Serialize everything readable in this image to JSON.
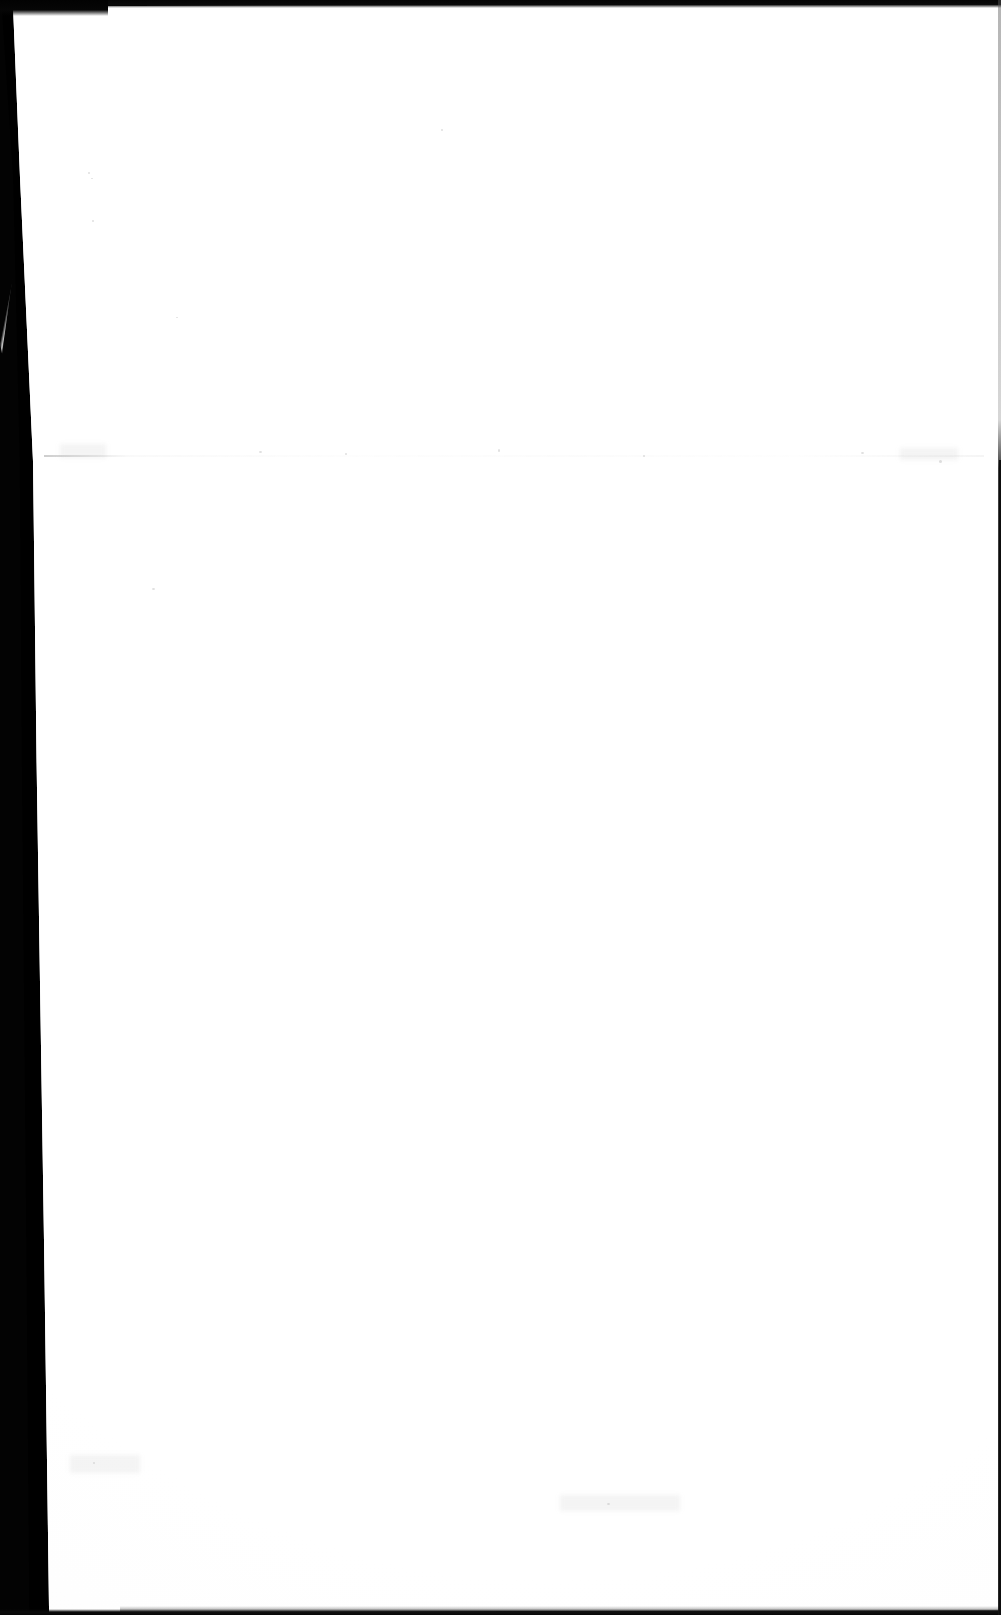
{
  "document": {
    "kind": "scanned-page",
    "page_content": "",
    "page_note": "blank page",
    "width_px": 1001,
    "height_px": 1615
  },
  "colors": {
    "paper": "#fefefe",
    "scan_bed": "#030303",
    "border": "#0a0a0a",
    "artifact": "#bababa"
  },
  "artifacts": {
    "left_gutter": "scanner-bed-shadow",
    "left_sliver": "page-corner-lift",
    "top_border": "scan-edge-top",
    "bottom_border": "scan-edge-bottom",
    "right_border": "scan-edge-right",
    "fold_seam": "horizontal-fold-crease"
  },
  "specks": [
    {
      "x": 88,
      "y": 172,
      "w": 2,
      "h": 2
    },
    {
      "x": 91,
      "y": 178,
      "w": 2,
      "h": 1
    },
    {
      "x": 92,
      "y": 220,
      "w": 2,
      "h": 2
    },
    {
      "x": 441,
      "y": 129,
      "w": 2,
      "h": 2
    },
    {
      "x": 176,
      "y": 317,
      "w": 2,
      "h": 1
    },
    {
      "x": 259,
      "y": 451,
      "w": 3,
      "h": 2
    },
    {
      "x": 345,
      "y": 453,
      "w": 2,
      "h": 2
    },
    {
      "x": 498,
      "y": 449,
      "w": 2,
      "h": 3
    },
    {
      "x": 643,
      "y": 455,
      "w": 2,
      "h": 2
    },
    {
      "x": 861,
      "y": 452,
      "w": 3,
      "h": 2
    },
    {
      "x": 939,
      "y": 460,
      "w": 3,
      "h": 3
    },
    {
      "x": 152,
      "y": 588,
      "w": 3,
      "h": 2
    },
    {
      "x": 607,
      "y": 1503,
      "w": 3,
      "h": 2
    },
    {
      "x": 93,
      "y": 1462,
      "w": 2,
      "h": 2
    }
  ],
  "smudges": [
    {
      "x": 60,
      "y": 444,
      "w": 46,
      "h": 14
    },
    {
      "x": 900,
      "y": 448,
      "w": 58,
      "h": 12
    },
    {
      "x": 70,
      "y": 1455,
      "w": 70,
      "h": 18
    },
    {
      "x": 560,
      "y": 1495,
      "w": 120,
      "h": 16
    }
  ]
}
